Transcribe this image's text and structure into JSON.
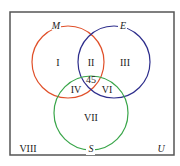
{
  "diagram": {
    "type": "venn",
    "universe_label": "U",
    "sets": [
      {
        "label": "M",
        "color": "#e0502a"
      },
      {
        "label": "E",
        "color": "#2e2e8c"
      },
      {
        "label": "S",
        "color": "#3aa64a"
      }
    ],
    "regions": {
      "r1": "I",
      "r2": "II",
      "r3": "III",
      "r4": "IV",
      "r5": "45",
      "r6": "VI",
      "r7": "VII",
      "r8": "VIII"
    }
  }
}
